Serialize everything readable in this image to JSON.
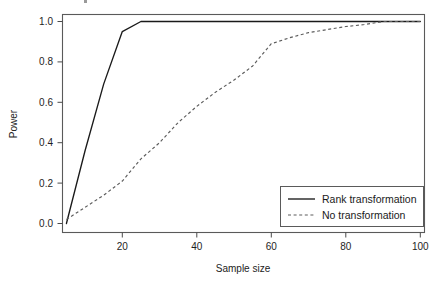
{
  "chart_data": {
    "type": "line",
    "title": "",
    "xlabel": "Sample size",
    "ylabel": "Power",
    "xlim": [
      3,
      100
    ],
    "ylim": [
      0.0,
      1.02
    ],
    "grid": false,
    "legend_position": "bottom-right",
    "xticks": [
      20,
      40,
      60,
      80,
      100
    ],
    "xtick_labels": [
      "20",
      "40",
      "60",
      "80",
      "100"
    ],
    "yticks": [
      0.0,
      0.2,
      0.4,
      0.6,
      0.8,
      1.0
    ],
    "ytick_labels": [
      "0.0",
      "0.2",
      "0.4",
      "0.6",
      "0.8",
      "1.0"
    ],
    "series": [
      {
        "name": "Rank transformation",
        "style": "solid",
        "color": "#1a1a1a",
        "x": [
          5,
          10,
          15,
          20,
          25,
          30,
          35,
          40,
          45,
          50,
          55,
          60,
          65,
          70,
          75,
          80,
          85,
          90,
          95,
          100
        ],
        "values": [
          0.0,
          0.36,
          0.69,
          0.95,
          1.0,
          1.0,
          1.0,
          1.0,
          1.0,
          1.0,
          1.0,
          1.0,
          1.0,
          1.0,
          1.0,
          1.0,
          1.0,
          1.0,
          1.0,
          1.0
        ]
      },
      {
        "name": "No transformation",
        "style": "dashed",
        "color": "#5c5c5c",
        "x": [
          5,
          10,
          15,
          20,
          25,
          30,
          35,
          40,
          45,
          50,
          55,
          60,
          65,
          70,
          75,
          80,
          85,
          90,
          95,
          100
        ],
        "values": [
          0.02,
          0.08,
          0.14,
          0.21,
          0.32,
          0.4,
          0.5,
          0.58,
          0.65,
          0.71,
          0.78,
          0.89,
          0.92,
          0.945,
          0.96,
          0.975,
          0.985,
          1.0,
          1.0,
          1.0
        ]
      }
    ]
  },
  "axes": {
    "x_title": "Sample size",
    "y_title": "Power"
  },
  "legend": {
    "entries": [
      {
        "label": "Rank transformation",
        "style": "solid"
      },
      {
        "label": "No transformation",
        "style": "dashed"
      }
    ]
  },
  "ticks": {
    "x": [
      "20",
      "40",
      "60",
      "80",
      "100"
    ],
    "y": [
      "1.0",
      "0.8",
      "0.6",
      "0.4",
      "0.2",
      "0.0"
    ]
  }
}
